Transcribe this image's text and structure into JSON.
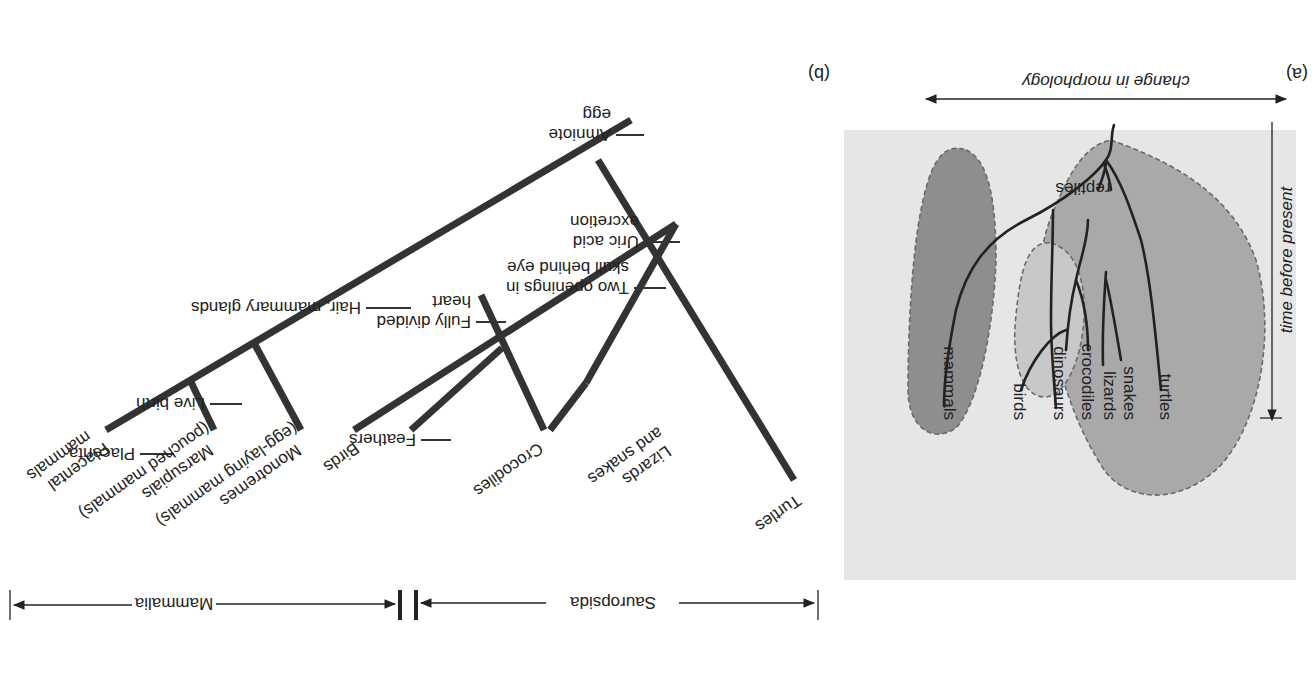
{
  "orientation": "rotated 180 degrees",
  "colors": {
    "panel_bg": "#e6e6e6",
    "reptiles_fill": "#a9a9a9",
    "birds_fill": "#c8c8c8",
    "mammals_fill": "#8e8e8e",
    "line": "#222222",
    "clade_line": "#3a3a3a"
  },
  "panel_a": {
    "label": "(a)",
    "x_axis_label": "change in morphology",
    "y_axis_label": "time before present",
    "groups": {
      "reptiles": "reptiles"
    },
    "taxa": [
      "mammals",
      "birds",
      "dinosaurs",
      "crocodiles",
      "lizards",
      "snakes",
      "turtles"
    ]
  },
  "panel_b": {
    "label": "(b)",
    "taxa": {
      "placental": [
        "Placental",
        "mammals"
      ],
      "marsupials": [
        "Marsupials",
        "(pouched mammals)"
      ],
      "monotremes": [
        "Monotremes",
        "(egg-laying mammals)"
      ],
      "birds": [
        "Birds"
      ],
      "crocodiles": [
        "Crocodiles"
      ],
      "lizards": [
        "Lizards",
        "and snakes"
      ],
      "turtles": [
        "Turtles"
      ]
    },
    "characters": {
      "amniote": [
        "Amniote",
        "egg"
      ],
      "uric": [
        "Uric acid",
        "excretion"
      ],
      "two_openings": [
        "Two openings in",
        "skull behind eye"
      ],
      "hair": [
        "Hair, mammary glands"
      ],
      "fully_divided": [
        "Fully divided",
        "heart"
      ],
      "live_birth": [
        "Live birth"
      ],
      "feathers": [
        "Feathers"
      ],
      "placenta": [
        "Placenta"
      ]
    },
    "groups": {
      "mammalia": "Mammalia",
      "sauropsida": "Sauropsida"
    }
  }
}
